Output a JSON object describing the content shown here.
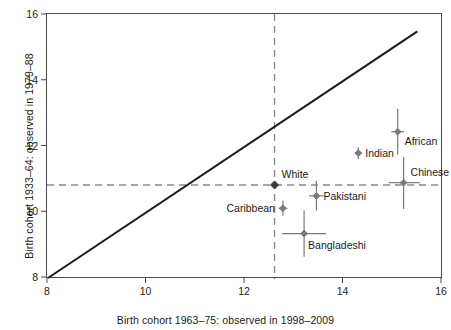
{
  "chart_data": {
    "type": "scatter",
    "title": "",
    "xlabel": "Birth cohort 1963–75: observed in 1998–2009",
    "ylabel": "Birth cohort 1933–64: observed in 1979–88",
    "xlim": [
      8,
      16
    ],
    "ylim": [
      8,
      16
    ],
    "xticks": [
      "8",
      "10",
      "12",
      "14",
      "16"
    ],
    "yticks": [
      "8",
      "10",
      "12",
      "14",
      "16"
    ],
    "xtick_values": [
      8,
      10,
      12,
      14,
      16
    ],
    "ytick_values": [
      8,
      10,
      12,
      14,
      16
    ],
    "grid": false,
    "legend": "none",
    "reference_line": {
      "name": "equality-line",
      "description": "line of equality y = x",
      "x": [
        8,
        15.5
      ],
      "y": [
        8,
        15.5
      ],
      "color": "#1b1b1b",
      "style": "solid"
    },
    "reference_dashed": {
      "name": "white-reference-lines",
      "vertical_x": 12.6,
      "horizontal_y": 10.83,
      "color": "#8a8a8a",
      "style": "dashed"
    },
    "points": [
      {
        "label": "White",
        "x": 12.6,
        "y": 10.83,
        "x_err_low": 12.55,
        "x_err_high": 12.65,
        "y_err_low": 10.75,
        "y_err_high": 10.9,
        "color": "#3a3a3a",
        "label_pos": "right"
      },
      {
        "label": "Caribbean",
        "x": 12.77,
        "y": 10.12,
        "x_err_low": 12.68,
        "x_err_high": 12.86,
        "y_err_low": 9.9,
        "y_err_high": 10.35,
        "color": "#7a7a7a",
        "label_pos": "left"
      },
      {
        "label": "Pakistani",
        "x": 13.45,
        "y": 10.5,
        "x_err_low": 13.3,
        "x_err_high": 13.6,
        "y_err_low": 10.05,
        "y_err_high": 10.95,
        "color": "#7a7a7a",
        "label_pos": "right"
      },
      {
        "label": "Bangladeshi",
        "x": 13.2,
        "y": 9.35,
        "x_err_low": 12.75,
        "x_err_high": 13.65,
        "y_err_low": 8.65,
        "y_err_high": 10.05,
        "color": "#7a7a7a",
        "label_pos": "below-right"
      },
      {
        "label": "Indian",
        "x": 14.3,
        "y": 11.8,
        "x_err_low": 14.23,
        "x_err_high": 14.37,
        "y_err_low": 11.62,
        "y_err_high": 11.98,
        "color": "#7a7a7a",
        "label_pos": "right"
      },
      {
        "label": "African",
        "x": 15.1,
        "y": 12.45,
        "x_err_low": 14.97,
        "x_err_high": 15.23,
        "y_err_low": 11.75,
        "y_err_high": 13.15,
        "color": "#7a7a7a",
        "label_pos": "right"
      },
      {
        "label": "Chinese",
        "x": 15.22,
        "y": 10.9,
        "x_err_low": 14.92,
        "x_err_high": 15.55,
        "y_err_low": 10.1,
        "y_err_high": 11.68,
        "color": "#7a7a7a",
        "label_pos": "right-above"
      }
    ]
  },
  "figure": {
    "background": "#ffffff",
    "frame_color": "#4a4a4a",
    "marker_color": "#7a7a7a",
    "white_marker_color": "#3a3a3a",
    "dash_color": "#8a8a8a",
    "line_color": "#1b1b1b"
  }
}
